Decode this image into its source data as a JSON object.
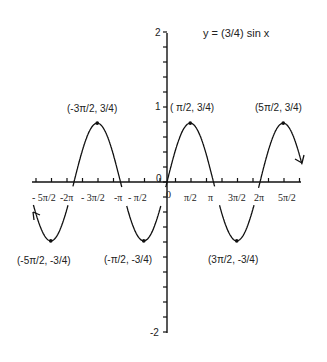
{
  "chart_data": {
    "type": "line",
    "title": "y = (3/4) sin x",
    "function": "y = (3/4) sin x",
    "xlabel": "",
    "ylabel": "",
    "xlim": [
      -8.9,
      9.1
    ],
    "ylim": [
      -2,
      2
    ],
    "grid": false,
    "legend": null,
    "amplitude": 0.75,
    "x_tick_labels": [
      "-5π/2",
      "-2π",
      "-3π/2",
      "-π",
      "-π/2",
      "0",
      "π/2",
      "π",
      "3π/2",
      "2π",
      "5π/2"
    ],
    "y_tick_labels": [
      "2",
      "1",
      "0",
      "-1",
      "-2"
    ],
    "annotated_points": [
      {
        "label": "(-5π/2, -3/4)",
        "x": -7.854,
        "y": -0.75
      },
      {
        "label": "(-3π/2, 3/4)",
        "x": -4.712,
        "y": 0.75
      },
      {
        "label": "(-π/2, -3/4)",
        "x": -1.571,
        "y": -0.75
      },
      {
        "label": "(π/2, 3/4)",
        "x": 1.571,
        "y": 0.75
      },
      {
        "label": "(3π/2, -3/4)",
        "x": 4.712,
        "y": -0.75
      },
      {
        "label": "(5π/2, 3/4)",
        "x": 7.854,
        "y": 0.75
      }
    ],
    "series": [
      {
        "name": "y = (3/4) sin x",
        "x": [
          -7.854,
          -6.283,
          -4.712,
          -3.142,
          -1.571,
          0,
          1.571,
          3.142,
          4.712,
          6.283,
          7.854
        ],
        "values": [
          -0.75,
          0,
          0.75,
          0,
          -0.75,
          0,
          0.75,
          0,
          -0.75,
          0,
          0.75
        ]
      }
    ],
    "arrows_on_ends": true
  },
  "labels": {
    "title": "y = (3/4) sin x",
    "y_ticks": {
      "p2": "2",
      "p1": "1",
      "zero": "0",
      "m2": "-2"
    },
    "x_ticks": {
      "m5pi2": "- 5π/2",
      "m2pi": "-2π",
      "m3pi2": "- 3π/2",
      "mpi": "-π",
      "mpi2": "- π/2",
      "origin": "0",
      "pi2": "π/2",
      "pi": "π",
      "p3pi2": "3π/2",
      "p2pi": "2π",
      "p5pi2": "5π/2"
    },
    "points": {
      "m3pi2": "(-3π/2, 3/4)",
      "pi2": "( π/2, 3/4)",
      "p5pi2": "(5π/2, 3/4)",
      "m5pi2": "(-5π/2, -3/4)",
      "mpi2": "(-π/2, -3/4)",
      "p3pi2": "(3π/2, -3/4)"
    }
  }
}
